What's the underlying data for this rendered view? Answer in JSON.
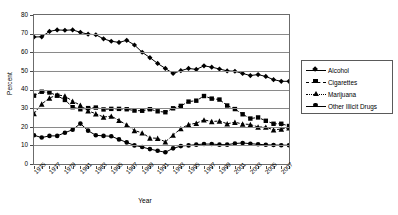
{
  "chart_data": {
    "type": "line",
    "title": "",
    "xlabel": "Year",
    "ylabel": "Percent",
    "ylim": [
      0,
      80
    ],
    "ytick_step": 10,
    "yticks": [
      0,
      10,
      20,
      30,
      40,
      50,
      60,
      70,
      80
    ],
    "grid": true,
    "grid_axis": "y",
    "legend_position": "right",
    "x": [
      1975,
      1976,
      1977,
      1978,
      1979,
      1980,
      1981,
      1982,
      1983,
      1984,
      1985,
      1986,
      1987,
      1988,
      1989,
      1990,
      1991,
      1992,
      1993,
      1994,
      1995,
      1996,
      1997,
      1998,
      1999,
      2000,
      2001,
      2002,
      2003,
      2004,
      2005,
      2006,
      2007,
      2008
    ],
    "xtick_labels": [
      "1975",
      "1977",
      "1979",
      "1981",
      "1983",
      "1985",
      "1987",
      "1989",
      "1991",
      "1993",
      "1995",
      "1997",
      "1999",
      "2001",
      "2003",
      "2005",
      "2007"
    ],
    "series": [
      {
        "name": "Alcohol",
        "marker": "diamond",
        "linestyle": "solid",
        "color": "#000000",
        "values": [
          68.2,
          68.3,
          71.2,
          72.0,
          71.8,
          72.0,
          70.7,
          69.7,
          69.4,
          67.2,
          65.9,
          65.3,
          66.4,
          63.9,
          60.0,
          57.1,
          54.0,
          51.3,
          48.6,
          50.1,
          51.3,
          50.8,
          52.7,
          52.0,
          51.0,
          50.0,
          49.8,
          48.6,
          47.5,
          48.0,
          47.0,
          45.3,
          44.4,
          44.4
        ]
      },
      {
        "name": "Cigarettes",
        "marker": "square",
        "linestyle": "dashed",
        "color": "#000000",
        "values": [
          36.7,
          38.8,
          38.4,
          36.7,
          34.4,
          30.5,
          29.4,
          30.0,
          30.3,
          29.3,
          29.6,
          29.6,
          29.4,
          28.7,
          28.6,
          29.4,
          28.3,
          27.8,
          29.9,
          31.2,
          33.5,
          34.0,
          36.5,
          35.1,
          34.6,
          31.4,
          29.5,
          26.7,
          24.4,
          25.0,
          23.2,
          21.6,
          21.6,
          20.4
        ]
      },
      {
        "name": "Marijuana",
        "marker": "triangle",
        "linestyle": "dashed",
        "color": "#000000",
        "values": [
          27.1,
          32.2,
          35.4,
          37.1,
          36.5,
          33.7,
          31.6,
          28.5,
          27.0,
          25.2,
          25.7,
          23.4,
          21.0,
          18.0,
          16.7,
          14.0,
          13.8,
          11.9,
          15.5,
          19.0,
          21.2,
          21.9,
          23.7,
          22.8,
          23.1,
          21.6,
          22.4,
          21.5,
          21.2,
          19.9,
          19.8,
          18.3,
          18.8,
          19.4
        ]
      },
      {
        "name": "Other Illicit Drugs",
        "marker": "circle",
        "linestyle": "solid",
        "color": "#000000",
        "values": [
          15.4,
          14.2,
          15.1,
          15.1,
          16.8,
          18.4,
          21.7,
          17.9,
          15.4,
          15.1,
          14.9,
          13.2,
          11.6,
          10.0,
          9.1,
          8.0,
          7.1,
          6.3,
          8.4,
          9.6,
          10.0,
          10.4,
          10.7,
          10.7,
          10.4,
          10.4,
          11.0,
          11.3,
          10.9,
          10.6,
          10.3,
          10.2,
          10.1,
          10.1
        ]
      }
    ]
  },
  "axis": {
    "y_title": "Percent",
    "x_title": "Year"
  },
  "legend": {
    "items": [
      {
        "label": "Alcohol"
      },
      {
        "label": "Cigarettes"
      },
      {
        "label": "Marijuana"
      },
      {
        "label": "Other Illicit Drugs"
      }
    ]
  }
}
